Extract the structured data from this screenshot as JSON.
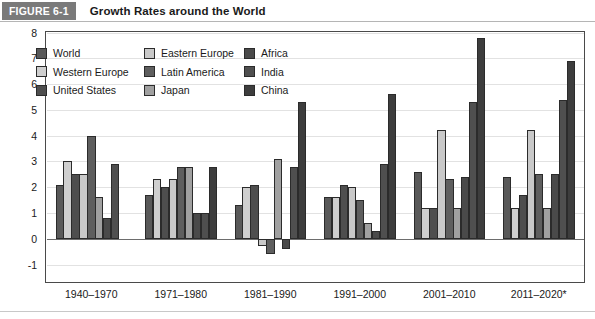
{
  "figure": {
    "tag": "FIGURE 6-1",
    "title": "Growth Rates around the World"
  },
  "legend": {
    "items": [
      {
        "label": "World",
        "color": "#595959"
      },
      {
        "label": "Eastern Europe",
        "color": "#c9c9c9"
      },
      {
        "label": "Africa",
        "color": "#4a4a4a"
      },
      {
        "label": "Western Europe",
        "color": "#cfcfcf"
      },
      {
        "label": "Latin America",
        "color": "#5e5e5e"
      },
      {
        "label": "India",
        "color": "#4f4f4f"
      },
      {
        "label": "United States",
        "color": "#4e4e4e"
      },
      {
        "label": "Japan",
        "color": "#a0a0a0"
      },
      {
        "label": "China",
        "color": "#3d3d3d"
      }
    ]
  },
  "chart_data": {
    "type": "bar",
    "title": "Growth Rates around the World",
    "xlabel": "",
    "ylabel": "",
    "ylim": [
      -1,
      8
    ],
    "yticks": [
      8,
      7,
      6,
      5,
      4,
      3,
      2,
      1,
      0,
      -1
    ],
    "ytick_labels": [
      "8",
      "7",
      "6",
      "5",
      "4",
      "3",
      "2",
      "1",
      "0",
      "-1"
    ],
    "grid": true,
    "legend_position": "top-left-inside",
    "categories": [
      "1940–1970",
      "1971–1980",
      "1981–1990",
      "1991–2000",
      "2001–2010",
      "2011–2020*"
    ],
    "series": [
      {
        "name": "World",
        "color": "#595959",
        "values": [
          2.1,
          1.7,
          1.3,
          1.6,
          2.6,
          2.4
        ]
      },
      {
        "name": "Western Europe",
        "color": "#cfcfcf",
        "values": [
          3.0,
          2.3,
          2.0,
          1.6,
          1.2,
          1.2
        ]
      },
      {
        "name": "United States",
        "color": "#4e4e4e",
        "values": [
          2.5,
          2.0,
          2.1,
          2.1,
          1.2,
          1.7
        ]
      },
      {
        "name": "Eastern Europe",
        "color": "#c9c9c9",
        "values": [
          2.5,
          2.3,
          -0.3,
          2.0,
          4.2,
          4.2
        ]
      },
      {
        "name": "Latin America",
        "color": "#5e5e5e",
        "values": [
          4.0,
          2.8,
          -0.6,
          1.5,
          2.3,
          2.5
        ]
      },
      {
        "name": "Japan",
        "color": "#a0a0a0",
        "values": [
          1.6,
          2.8,
          3.1,
          0.6,
          1.2,
          1.2
        ]
      },
      {
        "name": "Africa",
        "color": "#4a4a4a",
        "values": [
          0.8,
          1.0,
          -0.4,
          0.3,
          2.4,
          2.5
        ]
      },
      {
        "name": "India",
        "color": "#4f4f4f",
        "values": [
          2.9,
          1.0,
          2.8,
          2.9,
          5.3,
          5.4
        ]
      },
      {
        "name": "China",
        "color": "#3d3d3d",
        "values": [
          0.0,
          2.8,
          5.3,
          5.6,
          7.8,
          6.9
        ]
      }
    ]
  }
}
